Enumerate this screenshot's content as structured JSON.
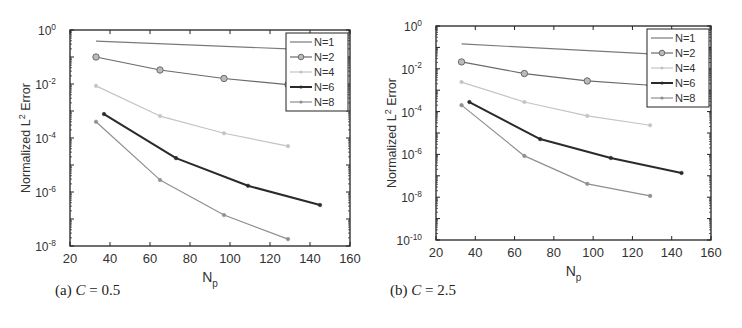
{
  "figure": {
    "captions": [
      {
        "prefix": "(a) ",
        "var": "C",
        "rest": " = 0.5"
      },
      {
        "prefix": "(b) ",
        "var": "C",
        "rest": " = 2.5"
      }
    ]
  },
  "chart_data": [
    {
      "type": "line",
      "title": "(a) C = 0.5",
      "xlabel": "N_p",
      "ylabel": "Normalized L^2 Error",
      "xlim": [
        20,
        160
      ],
      "ylim": [
        1e-08,
        1
      ],
      "yscale": "log",
      "xticks": [
        20,
        40,
        60,
        80,
        100,
        120,
        140,
        160
      ],
      "yticks": [
        "10^0",
        "10^-2",
        "10^-4",
        "10^-6",
        "10^-8"
      ],
      "ytick_exponents": [
        0,
        -2,
        -4,
        -6,
        -8
      ],
      "grid": false,
      "legend_position": "upper right",
      "series": [
        {
          "name": "N=1",
          "color": "#7a7a7a",
          "marker": "none",
          "width": 1.2,
          "x": [
            33,
            129
          ],
          "y": [
            0.39,
            0.2
          ]
        },
        {
          "name": "N=2",
          "color": "#6a6a6a",
          "marker": "circle",
          "width": 1.2,
          "x": [
            33,
            65,
            97,
            129
          ],
          "y": [
            0.1,
            0.033,
            0.016,
            0.0095
          ]
        },
        {
          "name": "N=4",
          "color": "#c4c4c4",
          "marker": "dot",
          "width": 1.2,
          "x": [
            33,
            65,
            97,
            129
          ],
          "y": [
            0.0085,
            0.00065,
            0.00015,
            5e-05
          ]
        },
        {
          "name": "N=6",
          "color": "#2a2a2a",
          "marker": "dot",
          "width": 2.0,
          "x": [
            37,
            73,
            109,
            145
          ],
          "y": [
            0.00077,
            1.8e-05,
            1.7e-06,
            3.3e-07
          ]
        },
        {
          "name": "N=8",
          "color": "#8f8f8f",
          "marker": "dot",
          "width": 1.2,
          "x": [
            33,
            65,
            97,
            129
          ],
          "y": [
            0.0004,
            2.8e-06,
            1.4e-07,
            1.8e-08
          ]
        }
      ]
    },
    {
      "type": "line",
      "title": "(b) C = 2.5",
      "xlabel": "N_p",
      "ylabel": "Normalized L^2 Error",
      "xlim": [
        20,
        160
      ],
      "ylim": [
        1e-10,
        1
      ],
      "yscale": "log",
      "xticks": [
        20,
        40,
        60,
        80,
        100,
        120,
        140,
        160
      ],
      "yticks": [
        "10^0",
        "10^-2",
        "10^-4",
        "10^-6",
        "10^-8",
        "10^-10"
      ],
      "ytick_exponents": [
        0,
        -2,
        -4,
        -6,
        -8,
        -10
      ],
      "grid": false,
      "legend_position": "upper right",
      "series": [
        {
          "name": "N=1",
          "color": "#7a7a7a",
          "marker": "none",
          "width": 1.2,
          "x": [
            33,
            129
          ],
          "y": [
            0.145,
            0.05
          ]
        },
        {
          "name": "N=2",
          "color": "#6a6a6a",
          "marker": "circle",
          "width": 1.2,
          "x": [
            33,
            65,
            97,
            129
          ],
          "y": [
            0.021,
            0.006,
            0.0027,
            0.0017
          ]
        },
        {
          "name": "N=4",
          "color": "#c4c4c4",
          "marker": "dot",
          "width": 1.2,
          "x": [
            33,
            65,
            97,
            129
          ],
          "y": [
            0.0024,
            0.00028,
            6.3e-05,
            2.3e-05
          ]
        },
        {
          "name": "N=6",
          "color": "#2a2a2a",
          "marker": "dot",
          "width": 2.0,
          "x": [
            37,
            73,
            109,
            145
          ],
          "y": [
            0.00028,
            5.2e-06,
            6.8e-07,
            1.35e-07
          ]
        },
        {
          "name": "N=8",
          "color": "#8f8f8f",
          "marker": "dot",
          "width": 1.2,
          "x": [
            33,
            65,
            97,
            129
          ],
          "y": [
            0.0002,
            8.5e-07,
            4.2e-08,
            1.15e-08
          ]
        }
      ]
    }
  ]
}
